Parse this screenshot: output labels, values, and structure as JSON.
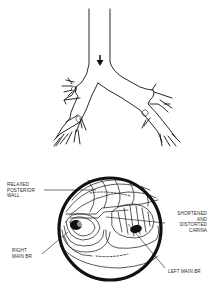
{
  "figure": {
    "top_panel": {
      "name": "bronchial-tree",
      "airflow_arrow": "down-arrow"
    },
    "bottom_panel": {
      "name": "bronchoscopic-view",
      "labels": {
        "relaxed_posterior_wall": "RELAXED\nPOSTERIOR\nWALL",
        "shortened_carina": "SHORTENED\nAND\nDISTORTED\nCARINA",
        "right_main_br": "RIGHT\nMAIN BR",
        "left_main_br": "LEFT MAIN BR"
      }
    }
  },
  "colors": {
    "ink": "#111111",
    "background": "#ffffff",
    "label_text": "#2a2a2a"
  }
}
